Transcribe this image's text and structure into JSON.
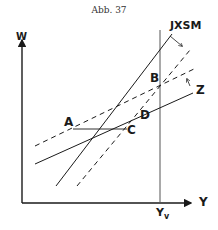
{
  "figure": {
    "title": "Abb. 37",
    "axes": {
      "y_label": "W",
      "x_label": "Y",
      "vertical_marker_label": "Y",
      "vertical_marker_subscript": "v"
    },
    "curves": {
      "steep_label": "JXSM",
      "shallow_label": "Z"
    },
    "points": {
      "a": "A",
      "b": "B",
      "c": "C",
      "d": "D"
    },
    "colors": {
      "ink": "#1a1a1a",
      "background": "#ffffff"
    }
  }
}
